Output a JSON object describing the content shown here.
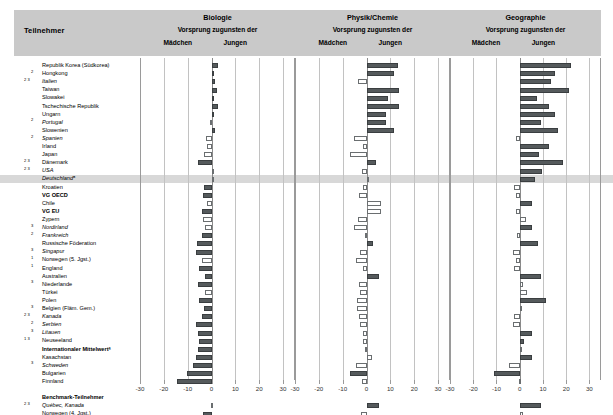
{
  "header": {
    "participant_label": "Teilnehmer",
    "panels": [
      {
        "subject": "Biologie",
        "vorsprung": "Vorsprung zugunsten der",
        "left": "Mädchen",
        "right": "Jungen"
      },
      {
        "subject": "Physik/Chemie",
        "vorsprung": "Vorsprung zugunsten der",
        "left": "Mädchen",
        "right": "Jungen"
      },
      {
        "subject": "Geographie",
        "vorsprung": "Vorsprung zugunsten der",
        "left": "Mädchen",
        "right": "Jungen"
      }
    ]
  },
  "chart_data": {
    "type": "bar",
    "xlabel": "",
    "ylabel": "Teilnehmer",
    "xlim": [
      -30,
      35
    ],
    "ticks": [
      -30,
      -20,
      -10,
      0,
      10,
      20,
      30
    ],
    "grid": true,
    "legend_position": "header",
    "orientation": "horizontal",
    "categories": [
      "Republik Korea (Südkorea)",
      "Hongkong",
      "Italien",
      "Taiwan",
      "Slowakei",
      "Tschechische Republik",
      "Ungarn",
      "Portugal",
      "Slowenien",
      "Spanien",
      "Irland",
      "Japan",
      "Dänemark",
      "USA",
      "Deutschlandᵃ",
      "Kroatien",
      "VG OECD",
      "Chile",
      "VG EU",
      "Zypern",
      "Nordirland",
      "Frankreich",
      "Russische Föderation",
      "Singapur",
      "Norwegen (5. Jgst.)",
      "England",
      "Australien",
      "Niederlande",
      "Türkei",
      "Polen",
      "Belgien (Fläm. Gem.)",
      "Kanada",
      "Serbien",
      "Litauen",
      "Neuseeland",
      "Internationaler Mittelwertᵃ",
      "Kasachstan",
      "Schweden",
      "Bulgarien",
      "Finnland",
      "",
      "Benchmark-Teilnehmer",
      "Québec, Kanada",
      "Norwegen (4. Jgst.)",
      "Ontario, Kanada"
    ],
    "category_meta": [
      {
        "sup": "",
        "italic": false,
        "bold": false
      },
      {
        "sup": "2",
        "italic": false,
        "bold": false
      },
      {
        "sup": "2 3",
        "italic": true,
        "bold": false
      },
      {
        "sup": "",
        "italic": false,
        "bold": false
      },
      {
        "sup": "",
        "italic": false,
        "bold": false
      },
      {
        "sup": "",
        "italic": false,
        "bold": false
      },
      {
        "sup": "",
        "italic": false,
        "bold": false
      },
      {
        "sup": "2",
        "italic": true,
        "bold": false
      },
      {
        "sup": "",
        "italic": false,
        "bold": false
      },
      {
        "sup": "2",
        "italic": true,
        "bold": false
      },
      {
        "sup": "",
        "italic": false,
        "bold": false
      },
      {
        "sup": "",
        "italic": false,
        "bold": false
      },
      {
        "sup": "2 3",
        "italic": false,
        "bold": false
      },
      {
        "sup": "2 3",
        "italic": true,
        "bold": false
      },
      {
        "sup": "",
        "italic": true,
        "bold": false
      },
      {
        "sup": "",
        "italic": false,
        "bold": false
      },
      {
        "sup": "",
        "italic": false,
        "bold": true
      },
      {
        "sup": "",
        "italic": false,
        "bold": false
      },
      {
        "sup": "",
        "italic": false,
        "bold": true
      },
      {
        "sup": "",
        "italic": false,
        "bold": false
      },
      {
        "sup": "3",
        "italic": true,
        "bold": false
      },
      {
        "sup": "2",
        "italic": true,
        "bold": false
      },
      {
        "sup": "",
        "italic": false,
        "bold": false
      },
      {
        "sup": "3",
        "italic": true,
        "bold": false
      },
      {
        "sup": "1",
        "italic": false,
        "bold": false
      },
      {
        "sup": "1",
        "italic": false,
        "bold": false
      },
      {
        "sup": "",
        "italic": false,
        "bold": false
      },
      {
        "sup": "3",
        "italic": false,
        "bold": false
      },
      {
        "sup": "",
        "italic": false,
        "bold": false
      },
      {
        "sup": "",
        "italic": false,
        "bold": false
      },
      {
        "sup": "3",
        "italic": false,
        "bold": false
      },
      {
        "sup": "2 3",
        "italic": true,
        "bold": false
      },
      {
        "sup": "2",
        "italic": true,
        "bold": false
      },
      {
        "sup": "3",
        "italic": true,
        "bold": false
      },
      {
        "sup": "1 3",
        "italic": false,
        "bold": false
      },
      {
        "sup": "",
        "italic": false,
        "bold": true
      },
      {
        "sup": "",
        "italic": false,
        "bold": false
      },
      {
        "sup": "3",
        "italic": true,
        "bold": false
      },
      {
        "sup": "",
        "italic": false,
        "bold": false
      },
      {
        "sup": "",
        "italic": false,
        "bold": false
      },
      {
        "sup": "",
        "italic": false,
        "bold": false
      },
      {
        "sup": "",
        "italic": false,
        "bold": true
      },
      {
        "sup": "2 3",
        "italic": true,
        "bold": false
      },
      {
        "sup": "",
        "italic": false,
        "bold": false
      },
      {
        "sup": "",
        "italic": false,
        "bold": false
      }
    ],
    "highlight_row": 14,
    "series": [
      {
        "name": "Biologie",
        "values": [
          2.6,
          1.2,
          1.5,
          2.3,
          0.8,
          2.6,
          1.0,
          -0.6,
          1.4,
          -2.2,
          -2.0,
          -3.0,
          -5.8,
          0.2,
          0.0,
          -3.1,
          -3.4,
          -2.0,
          -4.0,
          -3.5,
          -2.6,
          -4.0,
          -6.0,
          -6.5,
          -4.2,
          -5.1,
          -2.9,
          -5.6,
          -2.8,
          -5.4,
          -3.0,
          -4.0,
          -6.6,
          -5.6,
          -5.4,
          -5.5,
          -6.6,
          -7.6,
          -10.2,
          -14.5,
          null,
          null,
          -0.4,
          -3.5,
          -5.2
        ],
        "significant": [
          true,
          true,
          true,
          true,
          true,
          true,
          true,
          false,
          true,
          false,
          false,
          false,
          true,
          false,
          false,
          true,
          true,
          false,
          true,
          false,
          false,
          true,
          true,
          true,
          false,
          true,
          true,
          true,
          false,
          true,
          true,
          true,
          true,
          true,
          true,
          true,
          true,
          true,
          true,
          true,
          null,
          null,
          false,
          true,
          true
        ]
      },
      {
        "name": "Physik/Chemie",
        "values": [
          13.0,
          11.5,
          -3.6,
          13.8,
          9.1,
          13.5,
          8.0,
          8.2,
          11.7,
          -5.4,
          -1.4,
          -7.0,
          4.0,
          -2.0,
          0.0,
          -1.6,
          -3.0,
          6.1,
          6.0,
          -3.6,
          -5.2,
          -0.8,
          2.6,
          -2.7,
          -4.5,
          -1.6,
          5.3,
          -3.2,
          -2.6,
          -3.8,
          -4.2,
          -3.2,
          -2.9,
          -1.5,
          -1.4,
          -0.7,
          2.1,
          -4.4,
          -7.1,
          -2.0,
          null,
          null,
          5.3,
          -2.3,
          -0.5
        ],
        "significant": [
          true,
          true,
          false,
          true,
          true,
          true,
          true,
          true,
          true,
          false,
          false,
          false,
          true,
          false,
          false,
          false,
          false,
          false,
          false,
          false,
          false,
          false,
          true,
          false,
          false,
          false,
          true,
          false,
          false,
          false,
          false,
          false,
          false,
          false,
          false,
          false,
          false,
          false,
          true,
          false,
          null,
          null,
          true,
          false,
          false
        ]
      },
      {
        "name": "Geographie",
        "values": [
          22.0,
          15.0,
          13.5,
          21.3,
          7.5,
          12.5,
          15.2,
          9.3,
          16.7,
          -1.5,
          12.8,
          8.2,
          18.5,
          9.5,
          6.6,
          -2.6,
          -1.4,
          5.2,
          -1.5,
          2.9,
          5.5,
          -1.0,
          7.8,
          -2.8,
          -1.6,
          -2.4,
          9.2,
          1.3,
          3.2,
          11.5,
          0.8,
          -2.6,
          -2.8,
          5.4,
          1.9,
          0.8,
          5.1,
          -4.5,
          -11.0,
          -0.3,
          null,
          null,
          9.1,
          1.4,
          0.0
        ],
        "significant": [
          true,
          true,
          true,
          true,
          true,
          true,
          true,
          true,
          true,
          false,
          true,
          true,
          true,
          true,
          true,
          false,
          false,
          true,
          false,
          false,
          true,
          false,
          true,
          false,
          false,
          false,
          true,
          false,
          false,
          true,
          false,
          false,
          false,
          true,
          true,
          false,
          true,
          false,
          true,
          false,
          null,
          null,
          true,
          false,
          false
        ]
      }
    ]
  }
}
